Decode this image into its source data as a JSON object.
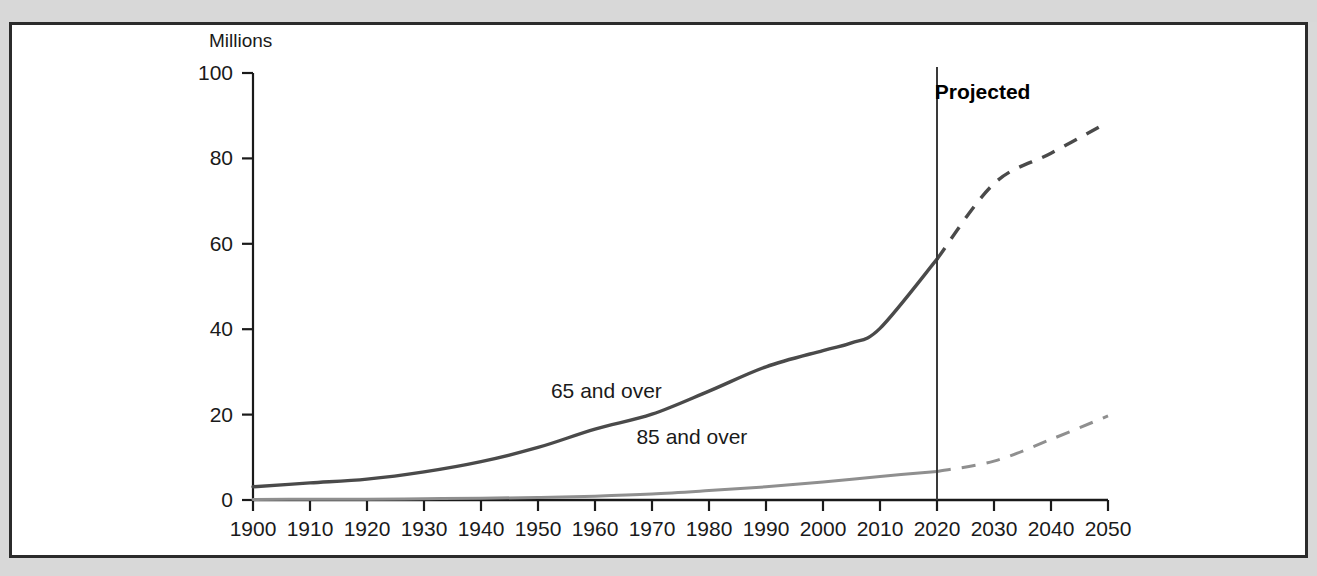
{
  "figure": {
    "y_axis_title": "Millions",
    "projection_annotation": "Projected",
    "series_label_65": "65 and over",
    "series_label_85": "85 and over",
    "colors": {
      "line_65": "#4a4a4a",
      "line_85": "#8f8f8f",
      "axis": "#1a1a1a",
      "divider": "#3a3a3a",
      "panel_background": "#ffffff",
      "page_background": "#d8d8d8",
      "frame": "#2b2b2b"
    }
  },
  "chart_data": {
    "type": "line",
    "title": "",
    "xlabel": "",
    "ylabel": "Millions",
    "xlim": [
      1900,
      2050
    ],
    "ylim": [
      0,
      100
    ],
    "grid": false,
    "legend": "inline-labels",
    "xticks": [
      1900,
      1910,
      1920,
      1930,
      1940,
      1950,
      1960,
      1970,
      1980,
      1990,
      2000,
      2010,
      2020,
      2030,
      2040,
      2050
    ],
    "yticks": [
      0,
      20,
      40,
      60,
      80,
      100
    ],
    "projection_start_year": 2020,
    "annotations": [
      {
        "text": "Projected",
        "x": 2028,
        "y": 94,
        "bold": true
      },
      {
        "text": "65 and over",
        "x": 1962,
        "y": 24
      },
      {
        "text": "85 and over",
        "x": 1977,
        "y": 13
      }
    ],
    "series": [
      {
        "name": "65 and over",
        "color": "#4a4a4a",
        "x": [
          1900,
          1910,
          1920,
          1930,
          1940,
          1950,
          1960,
          1970,
          1980,
          1990,
          2000,
          2005,
          2010,
          2020,
          2030,
          2040,
          2050
        ],
        "values": [
          3.1,
          4.0,
          4.9,
          6.6,
          9.0,
          12.3,
          16.6,
          20.1,
          25.5,
          31.2,
          35.0,
          36.8,
          40.2,
          56.4,
          74.1,
          81.2,
          88.5
        ],
        "historical_through": 2020,
        "projected_from": 2020,
        "historical_style": "solid",
        "projected_style": "dashed"
      },
      {
        "name": "85 and over",
        "color": "#8f8f8f",
        "x": [
          1900,
          1910,
          1920,
          1930,
          1940,
          1950,
          1960,
          1970,
          1980,
          1990,
          2000,
          2010,
          2020,
          2030,
          2040,
          2050
        ],
        "values": [
          0.1,
          0.2,
          0.2,
          0.3,
          0.4,
          0.6,
          0.9,
          1.4,
          2.2,
          3.1,
          4.2,
          5.5,
          6.7,
          9.1,
          14.2,
          19.7
        ],
        "historical_through": 2020,
        "projected_from": 2020,
        "historical_style": "solid",
        "projected_style": "dashed"
      }
    ]
  }
}
